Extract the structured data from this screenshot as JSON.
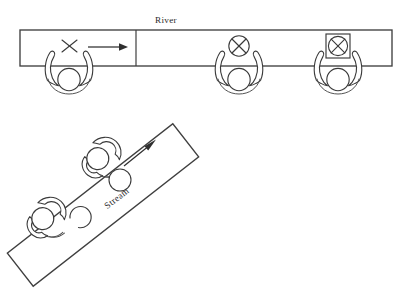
{
  "figure": {
    "stroke_color": "#3a3a3a",
    "background_color": "#ffffff"
  },
  "river_view": {
    "label": "River",
    "flow_arrow": "right-arrow",
    "band": {
      "x": 20,
      "y": 30,
      "width": 372,
      "height": 36
    },
    "divider_x": 136,
    "figures": [
      {
        "name": "thrower",
        "mark": "X",
        "mark_type": "x-mark",
        "center_x": 69,
        "has_ball": false
      },
      {
        "name": "catcher-circle-ball",
        "mark": "⊗",
        "mark_type": "circled-x-ball",
        "center_x": 239,
        "has_ball": true
      },
      {
        "name": "catcher-boxed-ball",
        "mark": "⊗",
        "mark_type": "boxed-circled-x-ball",
        "center_x": 338,
        "has_ball": true
      }
    ]
  },
  "stream_view": {
    "label": "Stream",
    "flow_arrow": "diagonal-arrow",
    "angle_degrees": -38,
    "figures": [
      {
        "name": "upper-swimmer",
        "ball_state": "full-circle",
        "has_ball": true
      },
      {
        "name": "lower-swimmer",
        "ball_state": "partial-arc",
        "has_ball": true
      }
    ]
  }
}
